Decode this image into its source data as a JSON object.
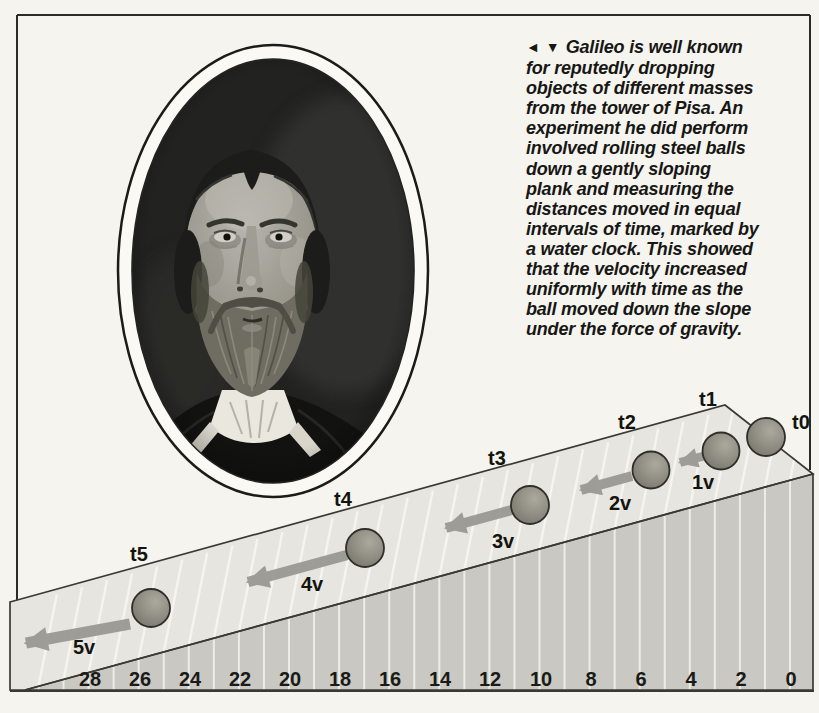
{
  "page": {
    "background_color": "#f6f4ef",
    "border_color": "#2b2b28"
  },
  "caption": {
    "marker_left": "◄",
    "marker_down": "▼",
    "lines": [
      "Galileo is well known",
      "for reputedly dropping",
      "objects of different masses",
      "from the tower of Pisa. An",
      "experiment he did perform",
      "involved rolling steel balls",
      "down a gently sloping",
      "plank and measuring the",
      "distances moved in equal",
      "intervals of time, marked by",
      "a water clock. This showed",
      "that the velocity increased",
      "uniformly with time as the",
      "ball moved down the slope",
      "under the force of gravity."
    ]
  },
  "portrait": {
    "subject": "Galileo — oval black-and-white portrait"
  },
  "ramp": {
    "time_labels": [
      "t0",
      "t1",
      "t2",
      "t3",
      "t4",
      "t5"
    ],
    "velocity_labels": [
      "1v",
      "2v",
      "3v",
      "4v",
      "5v"
    ],
    "scale_numbers": [
      "28",
      "26",
      "24",
      "22",
      "20",
      "18",
      "16",
      "14",
      "12",
      "10",
      "8",
      "6",
      "4",
      "2",
      "0"
    ],
    "colors": {
      "plank_top": "#e7e5df",
      "plank_face": "#c9c8c3",
      "ball": "#8f8d83",
      "arrow": "#9b9994"
    }
  }
}
